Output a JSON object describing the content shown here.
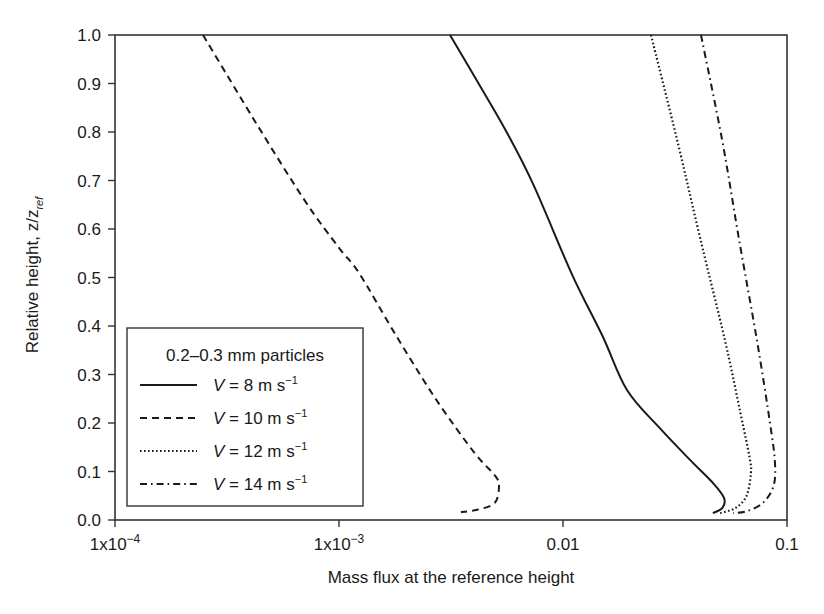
{
  "chart_data": {
    "type": "line",
    "title": "",
    "xlabel": "Mass flux at the reference height",
    "ylabel": "Relative height, z/z_ref",
    "ylabel_main": "Relative height, z/z",
    "ylabel_sub": "ref",
    "xscale": "log",
    "xlim": [
      0.0001,
      0.1
    ],
    "ylim": [
      0.0,
      1.0
    ],
    "grid": false,
    "x_ticks": [
      {
        "value": 0.0001,
        "label_base": "1x10",
        "label_exp": "−4"
      },
      {
        "value": 0.001,
        "label_base": "1x10",
        "label_exp": "−3"
      },
      {
        "value": 0.01,
        "label_base": "0.01",
        "label_exp": ""
      },
      {
        "value": 0.1,
        "label_base": "0.1",
        "label_exp": ""
      }
    ],
    "y_ticks": [
      {
        "value": 0.0,
        "label": "0.0"
      },
      {
        "value": 0.1,
        "label": "0.1"
      },
      {
        "value": 0.2,
        "label": "0.2"
      },
      {
        "value": 0.3,
        "label": "0.3"
      },
      {
        "value": 0.4,
        "label": "0.4"
      },
      {
        "value": 0.5,
        "label": "0.5"
      },
      {
        "value": 0.6,
        "label": "0.6"
      },
      {
        "value": 0.7,
        "label": "0.7"
      },
      {
        "value": 0.8,
        "label": "0.8"
      },
      {
        "value": 0.9,
        "label": "0.9"
      },
      {
        "value": 1.0,
        "label": "1.0"
      }
    ],
    "legend": {
      "title": "0.2–0.3 mm particles",
      "position": "lower left",
      "entries": [
        {
          "var": "V",
          "text": " = 8 m s",
          "exp": "−1",
          "style": "solid"
        },
        {
          "var": "V",
          "text": " = 10 m s",
          "exp": "−1",
          "style": "dashed"
        },
        {
          "var": "V",
          "text": " = 12 m s",
          "exp": "−1",
          "style": "dotted"
        },
        {
          "var": "V",
          "text": " = 14 m s",
          "exp": "−1",
          "style": "dashdot"
        }
      ]
    },
    "series": [
      {
        "name": "V = 8 m s-1",
        "style": "solid",
        "points": [
          {
            "x": 0.00313,
            "y": 1.0
          },
          {
            "x": 0.0042,
            "y": 0.9
          },
          {
            "x": 0.0056,
            "y": 0.8
          },
          {
            "x": 0.0074,
            "y": 0.69
          },
          {
            "x": 0.011,
            "y": 0.505
          },
          {
            "x": 0.015,
            "y": 0.38
          },
          {
            "x": 0.0193,
            "y": 0.268
          },
          {
            "x": 0.027,
            "y": 0.19
          },
          {
            "x": 0.0369,
            "y": 0.124
          },
          {
            "x": 0.047,
            "y": 0.075
          },
          {
            "x": 0.0524,
            "y": 0.045
          },
          {
            "x": 0.0515,
            "y": 0.025
          },
          {
            "x": 0.0467,
            "y": 0.014
          }
        ]
      },
      {
        "name": "V = 10 m s-1",
        "style": "dashed",
        "points": [
          {
            "x": 0.000247,
            "y": 1.0
          },
          {
            "x": 0.000418,
            "y": 0.825
          },
          {
            "x": 0.0007,
            "y": 0.66
          },
          {
            "x": 0.001,
            "y": 0.561
          },
          {
            "x": 0.00123,
            "y": 0.509
          },
          {
            "x": 0.0018,
            "y": 0.38
          },
          {
            "x": 0.0027,
            "y": 0.25
          },
          {
            "x": 0.004,
            "y": 0.14
          },
          {
            "x": 0.005,
            "y": 0.09
          },
          {
            "x": 0.00518,
            "y": 0.068
          },
          {
            "x": 0.00495,
            "y": 0.035
          },
          {
            "x": 0.00413,
            "y": 0.021
          },
          {
            "x": 0.0035,
            "y": 0.016
          }
        ]
      },
      {
        "name": "V = 12 m s-1",
        "style": "dotted",
        "points": [
          {
            "x": 0.0247,
            "y": 1.0
          },
          {
            "x": 0.0323,
            "y": 0.784
          },
          {
            "x": 0.041,
            "y": 0.58
          },
          {
            "x": 0.0528,
            "y": 0.371
          },
          {
            "x": 0.062,
            "y": 0.22
          },
          {
            "x": 0.068,
            "y": 0.13
          },
          {
            "x": 0.069,
            "y": 0.097
          },
          {
            "x": 0.066,
            "y": 0.05
          },
          {
            "x": 0.059,
            "y": 0.025
          },
          {
            "x": 0.0502,
            "y": 0.014
          }
        ]
      },
      {
        "name": "V = 14 m s-1",
        "style": "dashdot",
        "points": [
          {
            "x": 0.0413,
            "y": 1.0
          },
          {
            "x": 0.0513,
            "y": 0.784
          },
          {
            "x": 0.061,
            "y": 0.58
          },
          {
            "x": 0.0734,
            "y": 0.371
          },
          {
            "x": 0.084,
            "y": 0.2
          },
          {
            "x": 0.0883,
            "y": 0.12
          },
          {
            "x": 0.087,
            "y": 0.07
          },
          {
            "x": 0.078,
            "y": 0.035
          },
          {
            "x": 0.066,
            "y": 0.018
          },
          {
            "x": 0.0574,
            "y": 0.014
          }
        ]
      }
    ]
  }
}
